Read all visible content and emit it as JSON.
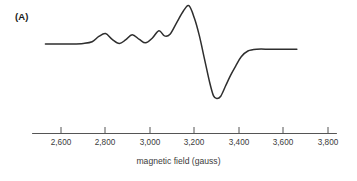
{
  "figure": {
    "panel_label": "(A)",
    "axis_title": "magnetic field (gauss)",
    "line_color": "#2e2e2e",
    "axis_color": "#555555",
    "text_color": "#3b3b3b",
    "background_color": "#ffffff"
  },
  "chart_data": {
    "type": "line",
    "title": "(A)",
    "xlabel": "magnetic field (gauss)",
    "ylabel": "",
    "grid": false,
    "legend": null,
    "xlim": [
      2450,
      3850
    ],
    "ylim": [
      -1.0,
      1.0
    ],
    "xticks": [
      2600,
      2800,
      3000,
      3200,
      3400,
      3600,
      3800
    ],
    "xticklabels": [
      "2,600",
      "2,800",
      "3,000",
      "3,200",
      "3,400",
      "3,600",
      "3,800"
    ],
    "axis_line_range": [
      2470,
      3840
    ],
    "series": [
      {
        "name": "EPR derivative signal",
        "x": [
          2530,
          2600,
          2650,
          2700,
          2740,
          2770,
          2800,
          2830,
          2862,
          2890,
          2920,
          2952,
          2980,
          3010,
          3040,
          3065,
          3090,
          3120,
          3150,
          3175,
          3200,
          3222,
          3245,
          3268,
          3285,
          3300,
          3318,
          3340,
          3362,
          3385,
          3410,
          3440,
          3480,
          3540,
          3600,
          3660
        ],
        "y": [
          0.06,
          0.06,
          0.06,
          0.07,
          0.1,
          0.19,
          0.24,
          0.14,
          0.07,
          0.13,
          0.22,
          0.14,
          0.08,
          0.16,
          0.29,
          0.2,
          0.23,
          0.43,
          0.63,
          0.72,
          0.5,
          0.2,
          -0.2,
          -0.6,
          -0.83,
          -0.88,
          -0.84,
          -0.66,
          -0.48,
          -0.32,
          -0.16,
          -0.06,
          -0.03,
          -0.03,
          -0.03,
          -0.03
        ]
      }
    ]
  },
  "ticks": [
    {
      "value": 2600,
      "label": "2,600",
      "x": 61
    },
    {
      "value": 2800,
      "label": "2,800",
      "x": 105
    },
    {
      "value": 3000,
      "label": "3,000",
      "x": 150
    },
    {
      "value": 3200,
      "label": "3,200",
      "x": 194
    },
    {
      "value": 3400,
      "label": "3,400",
      "x": 239
    },
    {
      "value": 3600,
      "label": "3,600",
      "x": 283
    },
    {
      "value": 3800,
      "label": "3,800",
      "x": 328
    }
  ]
}
